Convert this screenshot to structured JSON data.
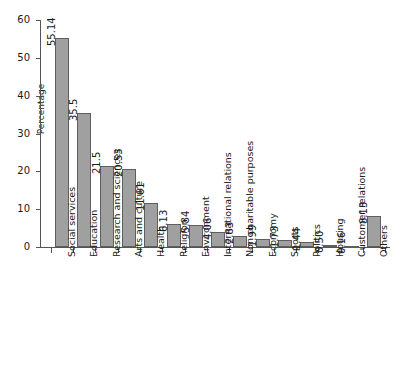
{
  "chart_data": {
    "type": "bar",
    "title": "",
    "subtitle": "",
    "xlabel": "",
    "ylabel": "Percentage",
    "ylim": [
      0,
      60
    ],
    "yticks": [
      0,
      10,
      20,
      30,
      40,
      50,
      60
    ],
    "ytick_labels": [
      "0",
      "10",
      "20",
      "30",
      "40",
      "50",
      "60"
    ],
    "grid": false,
    "legend": false,
    "legend_position": "none",
    "bar_color": "#a0a0a0",
    "bar_edge_color": "#5e5e5e",
    "axis_color": "#555555",
    "background": "#ffffff",
    "value_labels_rotated": true,
    "categories": [
      "Social services",
      "Education",
      "Research and sciences",
      "Arts and culture",
      "Health",
      "Religion",
      "Environment",
      "International relations",
      "Non charitable purposes",
      "Economy",
      "Sports",
      "Politics",
      "Housing",
      "Customer relations",
      "Others"
    ],
    "values": [
      55.14,
      35.5,
      21.5,
      20.53,
      11.61,
      6.13,
      5.84,
      4.06,
      2.83,
      1.99,
      1.73,
      1.44,
      0.5,
      0.16,
      8.13
    ],
    "value_labels": [
      "55.14",
      "35.5",
      "21.5",
      "20.53",
      "11.61",
      "6.13",
      "5.84",
      "4.06",
      "2.83",
      "1.99",
      "1.73",
      "1.44",
      "0.50",
      "0.16",
      "8.13"
    ]
  }
}
